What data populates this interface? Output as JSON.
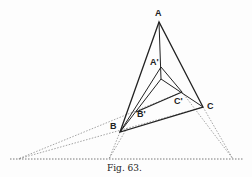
{
  "figure": {
    "caption": "Fig. 63.",
    "labels": {
      "A": "A",
      "A_prime": "A'",
      "B": "B",
      "B_prime": "B'",
      "C": "C",
      "C_prime": "C'"
    },
    "points": {
      "A": [
        159,
        22
      ],
      "A_prime": [
        161,
        67
      ],
      "J": [
        161,
        79
      ],
      "B": [
        120,
        132
      ],
      "B_prime": [
        136,
        112
      ],
      "C": [
        203,
        107
      ],
      "C_prime": [
        182,
        92
      ],
      "P_left": [
        18,
        159
      ],
      "P_mid": [
        109,
        159
      ],
      "P_right": [
        233,
        159
      ]
    },
    "colors": {
      "line": "#222222",
      "dashed": "#555555"
    }
  }
}
